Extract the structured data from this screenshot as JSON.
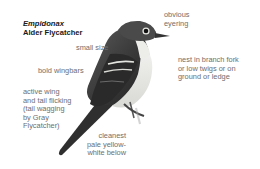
{
  "title": {
    "genus": "Empidonax",
    "species": "Alder Flycatcher"
  },
  "labels": {
    "small_size": "small size",
    "bold_wingbars": "bold wingbars",
    "active_wing": "active wing\nand tail flicking\n(tail wagging\nby Gray\nFlycatcher)",
    "obvious_eyering": "obvious\neyering",
    "nest": "nest in branch fork\nor low twigs or on\nground or ledge",
    "cleanest_below": "cleanest\npale yellow-\nwhite below"
  },
  "colors": {
    "text": "#6e6e6e",
    "title": "#1a1a1a",
    "bird_dark": "#2e2e2e",
    "bird_mid": "#6a6a6a",
    "bird_light": "#e8e8e4"
  }
}
